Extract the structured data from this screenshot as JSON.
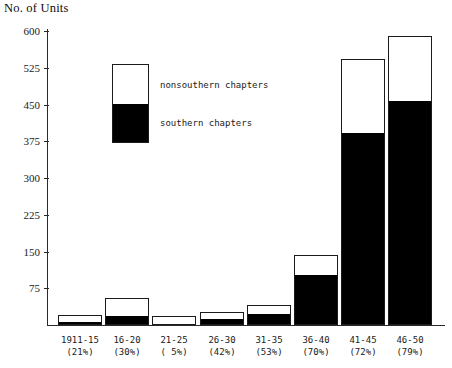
{
  "chart": {
    "axis_title": "No. of Units"
  },
  "legend": {
    "nonsouthern_label": "nonsouthern chapters",
    "southern_label": "southern chapters",
    "swatch_top_color": "#ffffff",
    "swatch_bottom_color": "#000000"
  },
  "chart_data": {
    "type": "bar",
    "subtype": "stacked",
    "title": "",
    "ylabel": "No. of Units",
    "xlabel": "",
    "ylim": [
      0,
      600
    ],
    "yticks": [
      75,
      150,
      225,
      300,
      375,
      450,
      525,
      600
    ],
    "ytick_labels": [
      "75",
      "150",
      "225",
      "300",
      "375",
      "450",
      "525",
      "600"
    ],
    "grid": false,
    "legend_position": "inside-upper-left",
    "categories": [
      "1911-15",
      "16-20",
      "21-25",
      "26-30",
      "31-35",
      "36-40",
      "41-45",
      "46-50"
    ],
    "category_sublabels": [
      "(21%)",
      "(30%)",
      "( 5%)",
      "(42%)",
      "(53%)",
      "(70%)",
      "(72%)",
      "(79%)"
    ],
    "southern_percent": [
      21,
      30,
      5,
      42,
      53,
      70,
      72,
      79
    ],
    "series": [
      {
        "name": "southern chapters",
        "color": "#000000",
        "values": [
          4,
          17,
          1,
          11,
          21,
          100,
          390,
          455
        ]
      },
      {
        "name": "nonsouthern chapters",
        "color": "#ffffff",
        "values": [
          16,
          39,
          17,
          15,
          19,
          43,
          153,
          135
        ]
      }
    ],
    "totals": [
      20,
      56,
      18,
      26,
      40,
      143,
      543,
      590
    ]
  }
}
